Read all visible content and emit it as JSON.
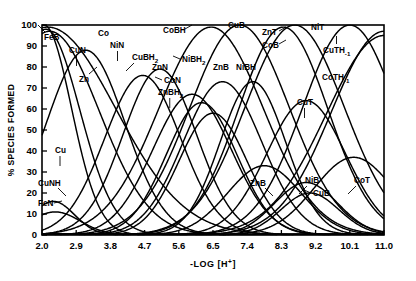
{
  "chart_data": {
    "type": "line",
    "title": "",
    "xlabel": "-LOG [H+]",
    "xlabel_parts": {
      "prefix": "-LOG [H",
      "sup": "+",
      "suffix": "]"
    },
    "ylabel": "% SPECIES FORMED",
    "xlim": [
      2.0,
      11.0
    ],
    "ylim": [
      0,
      100
    ],
    "grid": false,
    "legend_position": "inline-annotations",
    "xticks": [
      "2.0",
      "2.9",
      "3.8",
      "4.7",
      "5.6",
      "6.5",
      "7.4",
      "8.3",
      "9.2",
      "10.1",
      "11.0"
    ],
    "xtick_values": [
      2.0,
      2.9,
      3.8,
      4.7,
      5.6,
      6.5,
      7.4,
      8.3,
      9.2,
      10.1,
      11.0
    ],
    "yticks": [
      "0",
      "10",
      "20",
      "30",
      "40",
      "50",
      "60",
      "70",
      "80",
      "90",
      "100"
    ],
    "ytick_values": [
      0,
      10,
      20,
      30,
      40,
      50,
      60,
      70,
      80,
      90,
      100
    ],
    "line_color": "#000000",
    "series": [
      {
        "name": "FeB",
        "label": "FeB",
        "peak_x": 2.05,
        "peak_y": 100,
        "width": 1.05,
        "x": [
          2.0,
          2.2,
          2.5,
          2.8,
          3.1,
          3.4,
          3.7
        ],
        "values": [
          100,
          84,
          52,
          24,
          9,
          3,
          0
        ]
      },
      {
        "name": "FeN",
        "label": "FeN",
        "peak_x": 2.35,
        "peak_y": 11,
        "width": 0.95,
        "x": [
          2.0,
          2.2,
          2.4,
          2.6,
          2.9,
          3.2,
          3.6
        ],
        "values": [
          3,
          9,
          11,
          9,
          5,
          2,
          0
        ]
      },
      {
        "name": "CuNH",
        "label": "CuNH",
        "peak_x": 2.3,
        "peak_y": 16,
        "width": 0.8,
        "x": [
          2.0,
          2.15,
          2.3,
          2.5,
          2.7,
          3.0,
          3.3
        ],
        "values": [
          4,
          13,
          16,
          12,
          7,
          3,
          0
        ]
      },
      {
        "name": "Cu",
        "label": "Cu",
        "peak_x": 2.1,
        "peak_y": 98,
        "width": 1.3,
        "x": [
          2.0,
          2.3,
          2.6,
          2.9,
          3.3,
          3.7,
          4.1
        ],
        "values": [
          96,
          72,
          44,
          23,
          9,
          3,
          0
        ]
      },
      {
        "name": "CuN",
        "label": "CuN",
        "peak_x": 3.15,
        "peak_y": 88,
        "width": 1.5,
        "x": [
          2.0,
          2.4,
          2.8,
          3.15,
          3.5,
          3.9,
          4.4,
          4.9
        ],
        "values": [
          4,
          33,
          72,
          88,
          76,
          48,
          17,
          4
        ]
      },
      {
        "name": "Zn",
        "label": "Zn",
        "peak_x": 2.2,
        "peak_y": 97,
        "width": 1.9,
        "x": [
          2.0,
          2.5,
          3.0,
          3.5,
          4.0,
          4.6,
          5.2
        ],
        "values": [
          95,
          78,
          54,
          32,
          15,
          5,
          1
        ]
      },
      {
        "name": "Co",
        "label": "Co",
        "peak_x": 2.15,
        "peak_y": 99,
        "width": 2.6,
        "x": [
          2.0,
          2.6,
          3.2,
          3.8,
          4.4,
          5.0,
          5.6,
          6.2
        ],
        "values": [
          98,
          88,
          70,
          48,
          28,
          13,
          5,
          1
        ]
      },
      {
        "name": "NiN",
        "label": "NiN",
        "peak_x": 4.65,
        "peak_y": 76,
        "width": 1.45,
        "x": [
          3.4,
          3.8,
          4.2,
          4.65,
          5.1,
          5.5,
          6.0,
          6.5
        ],
        "values": [
          3,
          22,
          55,
          76,
          68,
          44,
          16,
          4
        ]
      },
      {
        "name": "CuBH2",
        "label": "CuBH",
        "sublabel": "2",
        "peak_x": 5.1,
        "peak_y": 79,
        "width": 1.4,
        "x": [
          3.9,
          4.3,
          4.7,
          5.1,
          5.5,
          5.9,
          6.4,
          6.9
        ],
        "values": [
          3,
          24,
          58,
          79,
          70,
          44,
          15,
          3
        ]
      },
      {
        "name": "ZnN",
        "label": "ZnN",
        "peak_x": 5.95,
        "peak_y": 67,
        "width": 1.5,
        "x": [
          4.6,
          5.0,
          5.5,
          5.95,
          6.4,
          6.8,
          7.3,
          7.8
        ],
        "values": [
          3,
          20,
          50,
          67,
          60,
          38,
          13,
          3
        ]
      },
      {
        "name": "CoN",
        "label": "CoN",
        "peak_x": 6.2,
        "peak_y": 63,
        "width": 1.35,
        "x": [
          5.0,
          5.4,
          5.8,
          6.2,
          6.6,
          7.0,
          7.5,
          8.0
        ],
        "values": [
          3,
          20,
          48,
          63,
          56,
          34,
          11,
          3
        ]
      },
      {
        "name": "ZnBH2",
        "label": "ZnBH",
        "sublabel": "2",
        "peak_x": 6.5,
        "peak_y": 58,
        "width": 1.3,
        "x": [
          5.3,
          5.7,
          6.1,
          6.5,
          6.9,
          7.3,
          7.8,
          8.3
        ],
        "values": [
          3,
          18,
          44,
          58,
          52,
          31,
          10,
          2
        ]
      },
      {
        "name": "NiBH2",
        "label": "NiBH",
        "sublabel": "2",
        "peak_x": 6.75,
        "peak_y": 73,
        "width": 1.5,
        "x": [
          5.4,
          5.8,
          6.3,
          6.75,
          7.2,
          7.6,
          8.1,
          8.6
        ],
        "values": [
          3,
          22,
          53,
          73,
          66,
          42,
          14,
          3
        ]
      },
      {
        "name": "CoBH",
        "label": "CoBH",
        "peak_x": 6.45,
        "peak_y": 99,
        "width": 2.0,
        "x": [
          4.8,
          5.3,
          5.8,
          6.45,
          7.0,
          7.5,
          8.1,
          8.7
        ],
        "values": [
          4,
          32,
          72,
          99,
          88,
          58,
          22,
          5
        ]
      },
      {
        "name": "CuB",
        "label": "CuB",
        "peak_x": 7.2,
        "peak_y": 100,
        "width": 1.9,
        "x": [
          5.6,
          6.1,
          6.6,
          7.2,
          7.7,
          8.2,
          8.7,
          9.2
        ],
        "values": [
          4,
          30,
          70,
          100,
          86,
          55,
          21,
          5
        ]
      },
      {
        "name": "ZnB",
        "label": "ZnB",
        "peak_x": 7.85,
        "peak_y": 33,
        "width": 1.4,
        "x": [
          6.6,
          7.0,
          7.45,
          7.85,
          8.3,
          8.7,
          9.2,
          9.7
        ],
        "values": [
          3,
          12,
          26,
          33,
          29,
          17,
          6,
          2
        ]
      },
      {
        "name": "NiBH",
        "label": "NiBH",
        "peak_x": 7.55,
        "peak_y": 73,
        "width": 1.25,
        "x": [
          6.5,
          6.9,
          7.2,
          7.55,
          7.9,
          8.3,
          8.7,
          9.2
        ],
        "values": [
          3,
          24,
          56,
          73,
          64,
          38,
          13,
          3
        ]
      },
      {
        "name": "ZnT",
        "label": "ZnT",
        "peak_x": 8.65,
        "peak_y": 100,
        "width": 1.9,
        "x": [
          7.0,
          7.5,
          8.0,
          8.65,
          9.2,
          9.7,
          10.2,
          10.7
        ],
        "values": [
          4,
          28,
          68,
          100,
          85,
          53,
          20,
          5
        ]
      },
      {
        "name": "CoB",
        "label": "CoB",
        "peak_x": 8.35,
        "peak_y": 99,
        "width": 1.7,
        "x": [
          6.9,
          7.4,
          7.9,
          8.35,
          8.85,
          9.3,
          9.8,
          10.3
        ],
        "values": [
          4,
          30,
          70,
          99,
          84,
          50,
          18,
          4
        ]
      },
      {
        "name": "NiB",
        "label": "NiB",
        "peak_x": 8.95,
        "peak_y": 25,
        "width": 1.2,
        "x": [
          7.9,
          8.3,
          8.65,
          8.95,
          9.3,
          9.7,
          10.2
        ],
        "values": [
          3,
          11,
          21,
          25,
          21,
          11,
          3
        ]
      },
      {
        "name": "CuB_2",
        "label": "CuB",
        "peak_x": 9.05,
        "peak_y": 20,
        "width": 1.1,
        "x": [
          8.1,
          8.45,
          8.75,
          9.05,
          9.4,
          9.8,
          10.3
        ],
        "values": [
          3,
          10,
          17,
          20,
          17,
          9,
          2
        ]
      },
      {
        "name": "CuT",
        "label": "CuT",
        "peak_x": 8.95,
        "peak_y": 64,
        "width": 1.5,
        "x": [
          7.6,
          8.1,
          8.5,
          8.95,
          9.4,
          9.9,
          10.4,
          10.9
        ],
        "values": [
          4,
          24,
          50,
          64,
          58,
          36,
          13,
          3
        ]
      },
      {
        "name": "NiT",
        "label": "NiT",
        "peak_x": 10.1,
        "peak_y": 100,
        "width": 1.8,
        "x": [
          8.4,
          8.9,
          9.4,
          10.1,
          10.6,
          11.0
        ],
        "values": [
          4,
          26,
          64,
          100,
          90,
          72
        ]
      },
      {
        "name": "CuTH-1",
        "label": "CuTH",
        "sublabel": "-1",
        "peak_x": 11.0,
        "peak_y": 97,
        "width": 2.0,
        "x": [
          8.8,
          9.3,
          9.8,
          10.3,
          10.7,
          11.0
        ],
        "values": [
          3,
          14,
          38,
          68,
          88,
          97
        ]
      },
      {
        "name": "CoTH-1",
        "label": "CoTH",
        "sublabel": "-1",
        "peak_x": 11.0,
        "peak_y": 95,
        "width": 2.2,
        "x": [
          8.6,
          9.2,
          9.7,
          10.2,
          10.6,
          11.0
        ],
        "values": [
          3,
          18,
          44,
          70,
          87,
          95
        ]
      },
      {
        "name": "CoT",
        "label": "CoT",
        "peak_x": 10.2,
        "peak_y": 37,
        "width": 1.5,
        "x": [
          9.0,
          9.4,
          9.8,
          10.2,
          10.6,
          11.0
        ],
        "values": [
          4,
          17,
          32,
          37,
          30,
          14
        ]
      }
    ],
    "annotations": [
      {
        "label": "FeB",
        "x": 44,
        "y": 40,
        "leader": "up-left"
      },
      {
        "label": "CuN",
        "x": 69,
        "y": 53,
        "leader": "down"
      },
      {
        "label": "Co",
        "x": 98,
        "y": 36,
        "leader": "none"
      },
      {
        "label": "Zn",
        "x": 79,
        "y": 82,
        "leader": "up-right"
      },
      {
        "label": "NiN",
        "x": 110,
        "y": 48,
        "leader": "down"
      },
      {
        "label": "CuBH",
        "sub": "2",
        "x": 132,
        "y": 60,
        "leader": "down-left"
      },
      {
        "label": "CoBH",
        "x": 163,
        "y": 33,
        "leader": "right-dash"
      },
      {
        "label": "ZnN",
        "x": 152,
        "y": 70,
        "leader": "down-right"
      },
      {
        "label": "NiBH",
        "sub": "2",
        "x": 182,
        "y": 62,
        "leader": "left"
      },
      {
        "label": "CoN",
        "x": 164,
        "y": 83,
        "leader": "left"
      },
      {
        "label": "ZnBH",
        "sub": "2",
        "x": 158,
        "y": 95,
        "leader": "down"
      },
      {
        "label": "CuB",
        "x": 228,
        "y": 28,
        "leader": "none"
      },
      {
        "label": "ZnB",
        "x": 213,
        "y": 70,
        "leader": "none"
      },
      {
        "label": "NiBH",
        "x": 236,
        "y": 70,
        "leader": "none"
      },
      {
        "label": "ZnT",
        "x": 262,
        "y": 35,
        "leader": "right-dash"
      },
      {
        "label": "CoB",
        "x": 262,
        "y": 48,
        "leader": "right-dash"
      },
      {
        "label": "NiT",
        "x": 311,
        "y": 30,
        "leader": "none"
      },
      {
        "label": "CuTH",
        "sub": "-1",
        "x": 323,
        "y": 53,
        "leader": "up"
      },
      {
        "label": "CoTH",
        "sub": "-1",
        "x": 322,
        "y": 80,
        "leader": "none"
      },
      {
        "label": "CuT",
        "x": 297,
        "y": 105,
        "leader": "down"
      },
      {
        "label": "Cu",
        "x": 55,
        "y": 153,
        "leader": "down"
      },
      {
        "label": "CuNH",
        "x": 38,
        "y": 186,
        "leader": "down-right"
      },
      {
        "label": "FeN",
        "x": 38,
        "y": 206,
        "leader": "right"
      },
      {
        "label": "ZnB",
        "x": 250,
        "y": 186,
        "leader": "down-right"
      },
      {
        "label": "NiB",
        "x": 305,
        "y": 183,
        "leader": "down-left"
      },
      {
        "label": "CuB",
        "x": 313,
        "y": 196,
        "leader": "left"
      },
      {
        "label": "CoT",
        "x": 354,
        "y": 183,
        "leader": "down-left"
      }
    ]
  }
}
